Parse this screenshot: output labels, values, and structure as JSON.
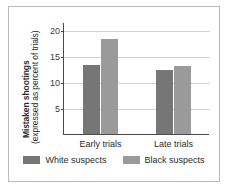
{
  "chart_data": {
    "type": "bar",
    "title": "",
    "xlabel": "",
    "ylabel": "Mistaken shootings (expressed as percent of trials)",
    "ylabel_line1": "Mistaken shootings",
    "ylabel_line2": "(expressed as percent of trials)",
    "categories": [
      "Early trials",
      "Late trials"
    ],
    "series": [
      {
        "name": "White suspects",
        "color": "#767676",
        "values": [
          13.3,
          12.2
        ]
      },
      {
        "name": "Black suspects",
        "color": "#9a9a9a",
        "values": [
          18.3,
          13.0
        ]
      }
    ],
    "ylim": [
      0,
      21.5
    ],
    "yticks": [
      5,
      10,
      15,
      20
    ],
    "ytick_labels": [
      "5",
      "10",
      "15",
      "20"
    ],
    "grid": true,
    "legend_position": "bottom"
  },
  "axis": {
    "ticks": [
      {
        "label": "20",
        "value": 20
      },
      {
        "label": "15",
        "value": 15
      },
      {
        "label": "10",
        "value": 10
      },
      {
        "label": "5",
        "value": 5
      }
    ]
  },
  "groups": [
    {
      "label": "Early trials",
      "bars": [
        {
          "series": "White suspects",
          "value": 13.3,
          "color": "#767676"
        },
        {
          "series": "Black suspects",
          "value": 18.3,
          "color": "#9a9a9a"
        }
      ]
    },
    {
      "label": "Late trials",
      "bars": [
        {
          "series": "White suspects",
          "value": 12.2,
          "color": "#767676"
        },
        {
          "series": "Black suspects",
          "value": 13.0,
          "color": "#9a9a9a"
        }
      ]
    }
  ],
  "legend": {
    "items": [
      {
        "label": "White suspects",
        "color": "#767676"
      },
      {
        "label": "Black suspects",
        "color": "#9a9a9a"
      }
    ]
  }
}
